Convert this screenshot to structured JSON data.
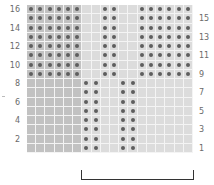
{
  "grid": {
    "columns": 18,
    "rows": 16,
    "colors": {
      "shaded": "#c2c2c2",
      "plain": "#dcdcdc",
      "dot": "#5e5e5e"
    },
    "shaded_columns": [
      1,
      2,
      3,
      4,
      5,
      6
    ],
    "upper_rows": {
      "range": [
        9,
        16
      ],
      "dot_columns": [
        1,
        2,
        3,
        4,
        5,
        6,
        9,
        10,
        13,
        14,
        15,
        16,
        17,
        18
      ]
    },
    "lower_rows": {
      "range": [
        1,
        8
      ],
      "dot_columns": [
        7,
        8,
        11,
        12
      ]
    }
  },
  "row_labels_left": [
    "16",
    "14",
    "12",
    "10",
    "8",
    "6",
    "4",
    "2"
  ],
  "row_labels_right": [
    "15",
    "13",
    "11",
    "9",
    "7",
    "5",
    "3",
    "1"
  ],
  "repeat_bracket": {
    "from_column": 7,
    "to_column": 18
  }
}
